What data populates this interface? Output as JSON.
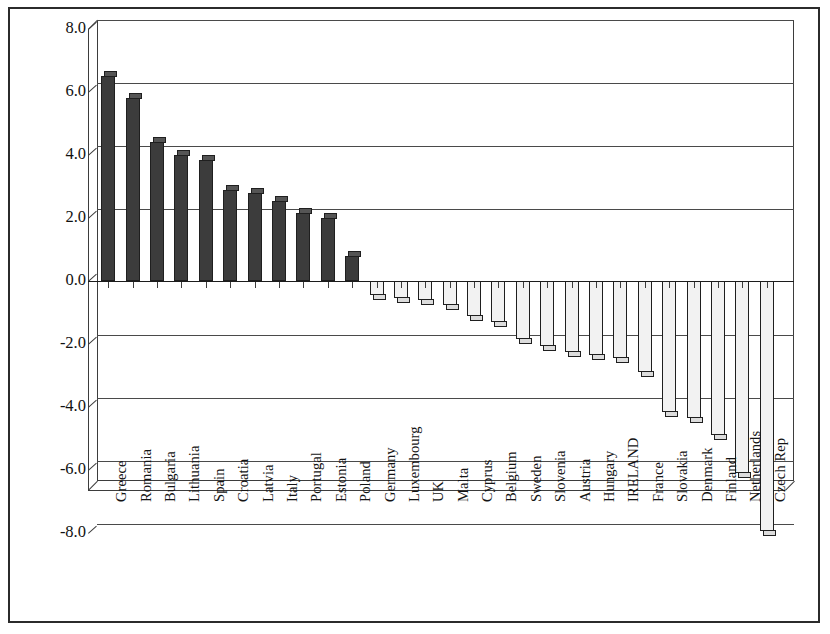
{
  "chart_data": {
    "type": "bar",
    "title": "",
    "xlabel": "",
    "ylabel": "",
    "ylim": [
      -8.0,
      8.0
    ],
    "ytick_labels": [
      "8.0",
      "6.0",
      "4.0",
      "2.0",
      "0.0",
      "-2.0",
      "-4.0",
      "-6.0",
      "-8.0"
    ],
    "ytick_values": [
      8.0,
      6.0,
      4.0,
      2.0,
      0.0,
      -2.0,
      -4.0,
      -6.0,
      -8.0
    ],
    "grid": true,
    "legend": "none",
    "style": "3d-column",
    "categories": [
      "Greece",
      "Romania",
      "Bulgaria",
      "Lithuania",
      "Spain",
      "Croatia",
      "Latvia",
      "Italy",
      "Portugal",
      "Estonia",
      "Poland",
      "Germany",
      "Luxembourg",
      "UK",
      "Malta",
      "Cyprus",
      "Belgium",
      "Sweden",
      "Slovenia",
      "Austria",
      "Hungary",
      "IRELAND",
      "France",
      "Slovakia",
      "Denmark",
      "Finland",
      "Netherlands",
      "Czech Rep"
    ],
    "values": [
      6.5,
      5.8,
      4.4,
      4.0,
      3.85,
      2.9,
      2.8,
      2.55,
      2.15,
      2.0,
      0.8,
      -0.45,
      -0.55,
      -0.6,
      -0.75,
      -1.1,
      -1.3,
      -1.85,
      -2.05,
      -2.25,
      -2.35,
      -2.45,
      -2.9,
      -4.15,
      -4.35,
      -4.9,
      -6.1,
      -7.95
    ],
    "colors": {
      "positive_bar": "#3c3c3c",
      "negative_bar": "#f2f2f2",
      "bar_outline": "#1f1f1f",
      "gridline": "#4a4a4a",
      "axis": "#3d3d3d",
      "frame": "#2b2b2b",
      "background": "#ffffff"
    }
  }
}
